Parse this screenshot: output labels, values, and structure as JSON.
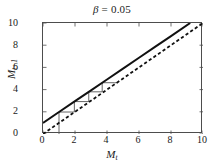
{
  "chart_data": {
    "type": "line",
    "title": "β = 0.05",
    "title_symbol": "β",
    "title_value": "= 0.05",
    "xlabel": "M",
    "xlabel_sub": "t",
    "ylabel": "M",
    "ylabel_sub": "t+1",
    "xlim": [
      0,
      10
    ],
    "ylim": [
      0,
      10
    ],
    "xticks": [
      0,
      2,
      4,
      6,
      8,
      10
    ],
    "yticks": [
      0,
      2,
      4,
      6,
      8,
      10
    ],
    "xtick_labels": [
      "0",
      "2",
      "4",
      "6",
      "8",
      "10"
    ],
    "ytick_labels": [
      "0",
      "2",
      "4",
      "6",
      "8",
      "10"
    ],
    "grid": false,
    "legend": false,
    "series": [
      {
        "name": "map-function",
        "style": "solid",
        "color": "#111111",
        "width": 2.0,
        "comment": "recurrence map M_{t+1} = f(M_t), approx y = 0.978x + 1.0",
        "x": [
          0,
          1,
          2,
          3,
          4,
          5,
          6,
          7,
          8,
          9.2
        ],
        "y": [
          1.0,
          1.98,
          2.96,
          3.93,
          4.91,
          5.89,
          6.87,
          7.85,
          8.82,
          10.0
        ]
      },
      {
        "name": "identity-line",
        "style": "dashed",
        "color": "#111111",
        "width": 1.8,
        "comment": "45 degree line y = x",
        "x": [
          0,
          10
        ],
        "y": [
          0,
          10
        ]
      },
      {
        "name": "cobweb-staircase",
        "style": "solid",
        "color": "#555555",
        "width": 0.9,
        "comment": "cobweb iteration steps from x=1 toward fixed point region",
        "points": [
          [
            1.0,
            0.0
          ],
          [
            1.0,
            1.98
          ],
          [
            1.96,
            1.98
          ],
          [
            1.96,
            2.92
          ],
          [
            2.86,
            2.92
          ],
          [
            2.86,
            3.8
          ],
          [
            3.7,
            3.8
          ],
          [
            3.7,
            4.62
          ],
          [
            4.48,
            4.62
          ],
          [
            4.62,
            4.62
          ]
        ]
      }
    ],
    "annotations": []
  },
  "figure": {
    "background": "#ffffff",
    "axis_color": "#4d4d4d",
    "text_color": "#1a1a1a"
  }
}
